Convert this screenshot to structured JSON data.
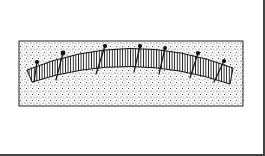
{
  "figure": {
    "type": "technical-line-drawing",
    "stake_count": 7,
    "colors": {
      "ink": "#1a1a1a",
      "paper": "#ffffff",
      "frame": "#444444"
    }
  }
}
